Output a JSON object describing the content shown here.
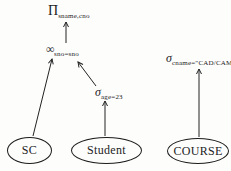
{
  "diagram": {
    "kind": "relational-algebra-query-tree",
    "colors": {
      "background": "#fdfdfc",
      "ink": "#1c1c1c"
    },
    "operators": {
      "projection": {
        "symbol": "Π",
        "subscript": "sname,cno"
      },
      "join": {
        "symbol": "∞",
        "subscript": "sno=sno"
      },
      "select_age": {
        "symbol": "σ",
        "subscript": "age=23"
      },
      "select_cname": {
        "symbol": "σ",
        "subscript": "cname=\"CAD/CAM\""
      }
    },
    "entities": [
      {
        "label": "SC"
      },
      {
        "label": "Student"
      },
      {
        "label": "COURSE"
      }
    ]
  }
}
